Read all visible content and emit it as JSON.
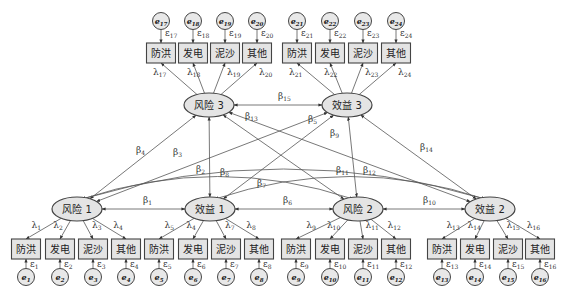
{
  "latent_nodes": [
    {
      "id": "r1",
      "label": "风险 1",
      "cx": 77,
      "cy": 209
    },
    {
      "id": "b1",
      "label": "效益 1",
      "cx": 210,
      "cy": 209
    },
    {
      "id": "r2",
      "label": "风险 2",
      "cx": 358,
      "cy": 209
    },
    {
      "id": "b2",
      "label": "效益 2",
      "cx": 490,
      "cy": 209
    },
    {
      "id": "r3",
      "label": "风险 3",
      "cx": 209,
      "cy": 105
    },
    {
      "id": "b3",
      "label": "效益 3",
      "cx": 347,
      "cy": 105
    }
  ],
  "indicator_labels": [
    "防洪",
    "发电",
    "泥沙",
    "其他"
  ],
  "bottom_groups": [
    {
      "parent": "r1",
      "xs": [
        26,
        60,
        93,
        126
      ],
      "lambdas": [
        "λ1",
        "λ2",
        "λ3",
        "λ4"
      ],
      "eps": [
        "ε1",
        "ε2",
        "ε3",
        "ε4"
      ],
      "errs": [
        "e1",
        "e2",
        "e3",
        "e4"
      ]
    },
    {
      "parent": "b1",
      "xs": [
        159,
        193,
        226,
        259
      ],
      "lambdas": [
        "λ5",
        "λ4",
        "λ7",
        "λ8"
      ],
      "eps": [
        "ε5",
        "ε6",
        "ε7",
        "ε8"
      ],
      "errs": [
        "e5",
        "e6",
        "e7",
        "e8"
      ]
    },
    {
      "parent": "r2",
      "xs": [
        296,
        330,
        363,
        396
      ],
      "lambdas": [
        "λ9",
        "λ10",
        "λ11",
        "λ12"
      ],
      "eps": [
        "ε9",
        "ε10",
        "ε11",
        "ε12"
      ],
      "errs": [
        "e9",
        "e10",
        "e11",
        "e12"
      ]
    },
    {
      "parent": "b2",
      "xs": [
        442,
        475,
        508,
        540
      ],
      "lambdas": [
        "λ13",
        "λ14",
        "λ15",
        "λ16"
      ],
      "eps": [
        "ε13",
        "ε14",
        "ε15",
        "ε16"
      ],
      "errs": [
        "e13",
        "e14",
        "e15",
        "e16"
      ]
    }
  ],
  "top_groups": [
    {
      "parent": "r3",
      "xs": [
        161,
        193,
        225,
        257
      ],
      "lambdas": [
        "λ17",
        "λ18",
        "λ19",
        "λ20"
      ],
      "eps": [
        "ε17",
        "ε18",
        "ε19",
        "ε20"
      ],
      "errs": [
        "e17",
        "e18",
        "e19",
        "e20"
      ]
    },
    {
      "parent": "b3",
      "xs": [
        297,
        330,
        363,
        396
      ],
      "lambdas": [
        "λ21",
        "λ22",
        "λ23",
        "λ24"
      ],
      "eps": [
        "ε21",
        "ε22",
        "ε23",
        "ε24"
      ],
      "errs": [
        "e21",
        "e22",
        "e23",
        "e24"
      ]
    }
  ],
  "paths": [
    {
      "from": "r1",
      "to": "b1",
      "label": "β1",
      "type": "bi",
      "lx": 143,
      "ly": 203
    },
    {
      "from": "b1",
      "to": "r2",
      "label": "β6",
      "type": "bi",
      "lx": 283,
      "ly": 203
    },
    {
      "from": "r2",
      "to": "b2",
      "label": "β10",
      "type": "bi",
      "lx": 423,
      "ly": 203
    },
    {
      "from": "r3",
      "to": "b3",
      "label": "β15",
      "type": "bi",
      "lx": 278,
      "ly": 99
    },
    {
      "from": "r1",
      "to": "r3",
      "label": "β4",
      "type": "line",
      "lx": 136,
      "ly": 153
    },
    {
      "from": "r1",
      "to": "b3",
      "label": "β5",
      "type": "line",
      "lx": 308,
      "ly": 122
    },
    {
      "from": "r1",
      "to": "r2",
      "label": "β2",
      "type": "curve",
      "lx": 196,
      "ly": 172
    },
    {
      "from": "r1",
      "to": "b2",
      "label": "β3",
      "type": "curve",
      "lx": 173,
      "ly": 155
    },
    {
      "from": "b1",
      "to": "r3",
      "label": "β8",
      "type": "bi",
      "lx": 220,
      "ly": 175
    },
    {
      "from": "b1",
      "to": "b3",
      "label": "β9",
      "type": "line",
      "lx": 330,
      "ly": 136
    },
    {
      "from": "b1",
      "to": "b2",
      "label": "β7",
      "type": "curve",
      "lx": 257,
      "ly": 186
    },
    {
      "from": "r3",
      "to": "r2",
      "label": "β11",
      "type": "line",
      "lx": 336,
      "ly": 173
    },
    {
      "from": "r3",
      "to": "b2",
      "label": "β13",
      "type": "line",
      "lx": 245,
      "ly": 119
    },
    {
      "from": "b3",
      "to": "r2",
      "label": "β12",
      "type": "line",
      "lx": 363,
      "ly": 173
    },
    {
      "from": "b3",
      "to": "b2",
      "label": "β14",
      "type": "line",
      "lx": 420,
      "ly": 150
    }
  ],
  "colors": {
    "node_fill": "#e4e4e4",
    "stroke": "#444444",
    "line": "#555555",
    "text": "#222222"
  }
}
